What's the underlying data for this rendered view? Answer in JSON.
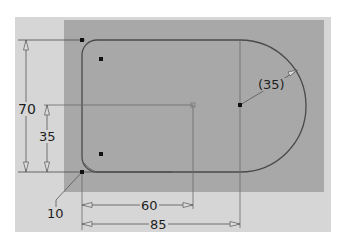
{
  "sketch": {
    "colors": {
      "background": "#ffffff",
      "outer_panel": "#d4d4d4",
      "profile_fill": "#a9a9a9",
      "lines": "#4a4a4a",
      "text": "#1e1e1e"
    },
    "dimensions": {
      "height_total": "70",
      "height_center": "35",
      "corner_fillet": "10",
      "center_offset": "60",
      "overall_length": "85",
      "arc_radius": "(35)"
    }
  }
}
